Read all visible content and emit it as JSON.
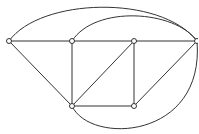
{
  "diagram": {
    "type": "graph",
    "nodes": [
      {
        "id": "A",
        "x": 9,
        "y": 41
      },
      {
        "id": "B",
        "x": 72,
        "y": 41
      },
      {
        "id": "C",
        "x": 134,
        "y": 41
      },
      {
        "id": "D",
        "x": 197,
        "y": 41
      },
      {
        "id": "E",
        "x": 72,
        "y": 106
      },
      {
        "id": "F",
        "x": 134,
        "y": 106
      }
    ],
    "edges": [
      {
        "from": "A",
        "to": "B",
        "shape": "line"
      },
      {
        "from": "B",
        "to": "C",
        "shape": "line"
      },
      {
        "from": "C",
        "to": "D",
        "shape": "line"
      },
      {
        "from": "A",
        "to": "E",
        "shape": "line"
      },
      {
        "from": "B",
        "to": "E",
        "shape": "line"
      },
      {
        "from": "C",
        "to": "E",
        "shape": "line"
      },
      {
        "from": "C",
        "to": "F",
        "shape": "line"
      },
      {
        "from": "E",
        "to": "F",
        "shape": "line"
      },
      {
        "from": "F",
        "to": "D",
        "shape": "line"
      },
      {
        "from": "A",
        "to": "D",
        "shape": "arc-top"
      },
      {
        "from": "B",
        "to": "D",
        "shape": "arc-top"
      },
      {
        "from": "E",
        "to": "D",
        "shape": "arc-bottom"
      }
    ]
  }
}
